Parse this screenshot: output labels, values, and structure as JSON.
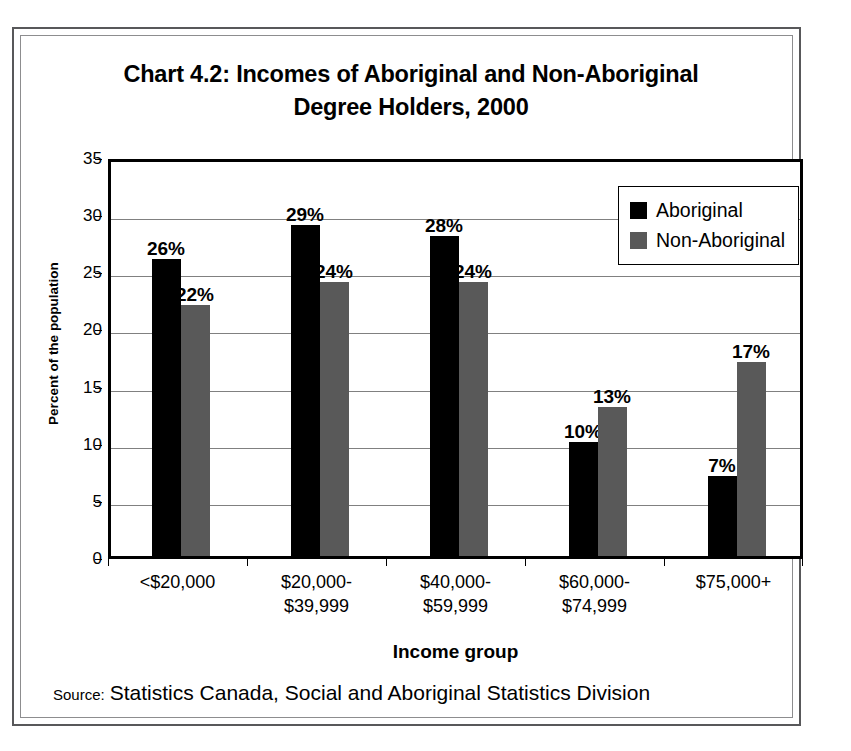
{
  "chart_data": {
    "type": "bar",
    "title": "Chart 4.2: Incomes of Aboriginal and Non-Aboriginal Degree Holders, 2000",
    "title_lines": [
      "Chart 4.2: Incomes of Aboriginal and Non-Aboriginal",
      "Degree Holders, 2000"
    ],
    "xlabel": "Income group",
    "ylabel": "Percent of the population",
    "ylim": [
      0,
      35
    ],
    "ytick_step": 5,
    "yticks": [
      35,
      30,
      25,
      20,
      15,
      10,
      5,
      0
    ],
    "grid": true,
    "grid_axis": "y",
    "legend_position": "top-right",
    "categories": [
      "<$20,000",
      "$20,000-$39,999",
      "$40,000-$59,999",
      "$60,000-$74,999",
      "$75,000+"
    ],
    "category_lines": [
      [
        "<$20,000"
      ],
      [
        "$20,000-",
        "$39,999"
      ],
      [
        "$40,000-",
        "$59,999"
      ],
      [
        "$60,000-",
        "$74,999"
      ],
      [
        "$75,000+"
      ]
    ],
    "series": [
      {
        "name": "Aboriginal",
        "color": "#000000",
        "values": [
          26,
          29,
          28,
          10,
          7
        ],
        "labels": [
          "26%",
          "29%",
          "28%",
          "10%",
          "7%"
        ]
      },
      {
        "name": "Non-Aboriginal",
        "color": "#595959",
        "values": [
          22,
          24,
          24,
          13,
          17
        ],
        "labels": [
          "22%",
          "24%",
          "24%",
          "13%",
          "17%"
        ]
      }
    ],
    "value_suffix": "%"
  },
  "source": {
    "label": "Source:",
    "text": "Statistics Canada, Social and Aboriginal Statistics Division"
  }
}
